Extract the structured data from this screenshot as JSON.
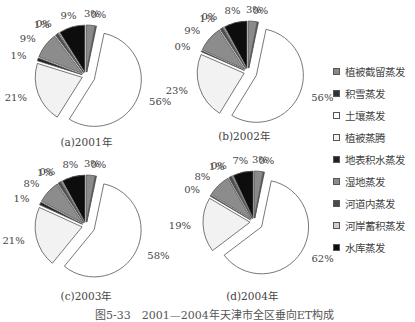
{
  "figure_caption": "图5-33　2001—2004年天津市全区垂向ET构成",
  "legend": [
    {
      "label": "植被截留蒸发",
      "color": "#8a8a8a"
    },
    {
      "label": "积雪蒸发",
      "color": "#333333"
    },
    {
      "label": "土壤蒸发",
      "color": "#ffffff"
    },
    {
      "label": "植被蒸腾",
      "color": "#f2f2f2"
    },
    {
      "label": "地表积水蒸发",
      "color": "#222222"
    },
    {
      "label": "湿地蒸发",
      "color": "#8c8c8c"
    },
    {
      "label": "河道内蒸发",
      "color": "#4a4a4a"
    },
    {
      "label": "河岸蓄积蒸发",
      "color": "#cfcfcf"
    },
    {
      "label": "水库蒸发",
      "color": "#0d0d0d"
    }
  ],
  "chart_data": [
    {
      "type": "pie",
      "title": "(a)2001年",
      "categories": [
        "植被截留蒸发",
        "积雪蒸发",
        "土壤蒸发",
        "植被蒸腾",
        "地表积水蒸发",
        "湿地蒸发",
        "河道内蒸发",
        "河岸蓄积蒸发",
        "水库蒸发"
      ],
      "values": [
        3,
        0,
        56,
        21,
        1,
        9,
        1,
        0,
        9
      ],
      "labels": [
        "3%",
        "0%",
        "56%",
        "21%",
        "1%",
        "9%",
        "1%",
        "0%",
        "9%"
      ],
      "exploded": true
    },
    {
      "type": "pie",
      "title": "(b)2002年",
      "categories": [
        "植被截留蒸发",
        "积雪蒸发",
        "土壤蒸发",
        "植被蒸腾",
        "地表积水蒸发",
        "湿地蒸发",
        "河道内蒸发",
        "河岸蓄积蒸发",
        "水库蒸发"
      ],
      "values": [
        3,
        0,
        56,
        23,
        0,
        9,
        1,
        0,
        8
      ],
      "labels": [
        "3%",
        "0%",
        "56%",
        "23%",
        "0%",
        "9%",
        "1%",
        "0%",
        "8%"
      ],
      "exploded": true
    },
    {
      "type": "pie",
      "title": "(c)2003年",
      "categories": [
        "植被截留蒸发",
        "积雪蒸发",
        "土壤蒸发",
        "植被蒸腾",
        "地表积水蒸发",
        "湿地蒸发",
        "河道内蒸发",
        "河岸蓄积蒸发",
        "水库蒸发"
      ],
      "values": [
        3,
        0,
        58,
        21,
        1,
        8,
        1,
        0,
        8
      ],
      "labels": [
        "3%",
        "0%",
        "58%",
        "21%",
        "1%",
        "8%",
        "1%",
        "0%",
        "8%"
      ],
      "exploded": true
    },
    {
      "type": "pie",
      "title": "(d)2004年",
      "categories": [
        "植被截留蒸发",
        "积雪蒸发",
        "土壤蒸发",
        "植被蒸腾",
        "地表积水蒸发",
        "湿地蒸发",
        "河道内蒸发",
        "河岸蓄积蒸发",
        "水库蒸发"
      ],
      "values": [
        3,
        0,
        62,
        19,
        0,
        8,
        1,
        0,
        7
      ],
      "labels": [
        "3%",
        "0%",
        "62%",
        "19%",
        "0%",
        "8%",
        "1%",
        "0%",
        "7%"
      ],
      "exploded": true
    }
  ],
  "layout": {
    "pies": [
      {
        "cx": 86,
        "cy": 76,
        "r": 47,
        "caption_x": 86,
        "caption_y": 146
      },
      {
        "cx": 248,
        "cy": 72,
        "r": 47,
        "caption_x": 244,
        "caption_y": 140
      },
      {
        "cx": 86,
        "cy": 226,
        "r": 47,
        "caption_x": 86,
        "caption_y": 300
      },
      {
        "cx": 254,
        "cy": 222,
        "r": 47,
        "caption_x": 252,
        "caption_y": 300
      }
    ]
  }
}
